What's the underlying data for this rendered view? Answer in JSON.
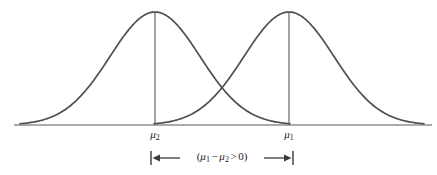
{
  "figure": {
    "title": "",
    "background_color": "#ffffff",
    "curve_color": "#4f4f52",
    "axis_color": "#58585a",
    "text_color": "#1c1c1e"
  },
  "axis": {
    "name": "horizontal-baseline",
    "x_start": 14,
    "x_end": 432,
    "y": 125
  },
  "tick_labels": [
    {
      "id": "mu2",
      "symbol": "μ",
      "subscript": "2",
      "x": 155,
      "y": 128
    },
    {
      "id": "mu1",
      "symbol": "μ",
      "subscript": "1",
      "x": 289,
      "y": 128
    }
  ],
  "annotation": {
    "open_paren": "(",
    "mu_first": "μ",
    "sub_first": "1",
    "minus": "−",
    "mu_second": "μ",
    "sub_second": "2",
    "comparison": ">",
    "value": "0",
    "close_paren": ")",
    "full_text": "(μ₁ − μ₂ > 0)",
    "bracket_left_x": 151,
    "bracket_right_x": 293,
    "bracket_y": 158
  },
  "chart_data": {
    "type": "line",
    "title": "",
    "subtitle": "",
    "xlabel": "",
    "ylabel": "",
    "grid": false,
    "legend_position": "none",
    "xlim": [
      14,
      432
    ],
    "ylim": [
      0,
      1
    ],
    "baseline_y_px": 125,
    "peak_y_px": 12,
    "annotations": [
      {
        "text": "(μ₁ − μ₂ > 0)",
        "type": "bracket-span",
        "from": "μ₂",
        "to": "μ₁"
      }
    ],
    "series": [
      {
        "name": "distribution-2",
        "mean_label": "μ₂",
        "mean_x_px": 155,
        "sigma_px": 45,
        "peak_height_px": 113,
        "x_min_px": 20,
        "x_max_px": 290
      },
      {
        "name": "distribution-1",
        "mean_label": "μ₁",
        "mean_x_px": 289,
        "sigma_px": 45,
        "peak_height_px": 113,
        "x_min_px": 154,
        "x_max_px": 424
      }
    ],
    "intersection_px": {
      "x": 222,
      "y": 98
    }
  }
}
